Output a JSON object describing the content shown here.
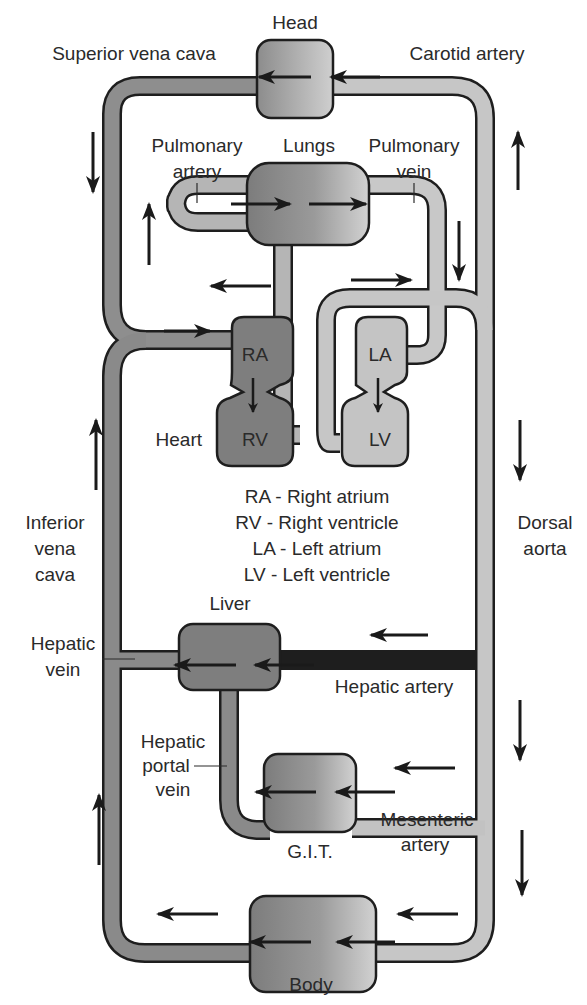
{
  "colors": {
    "deoxygenated_vessel": "#8a8a8a",
    "oxygenated_vessel": "#c6c6c6",
    "outline": "#1e1e1e",
    "arrow": "#1a1a1a",
    "right_heart": "#7e7e7e",
    "left_heart": "#c4c4c4",
    "organ_dark": "#7a7a7a",
    "organ_light": "#cfcfcf"
  },
  "organs": {
    "head": "Head",
    "lungs": "Lungs",
    "heart": "Heart",
    "liver": "Liver",
    "git": "G.I.T.",
    "body": "Body"
  },
  "chambers": {
    "ra": "RA",
    "rv": "RV",
    "la": "LA",
    "lv": "LV"
  },
  "vessels": {
    "superior_vena_cava": "Superior vena cava",
    "carotid_artery": "Carotid artery",
    "pulmonary_artery": [
      "Pulmonary",
      "artery"
    ],
    "pulmonary_vein": [
      "Pulmonary",
      "vein"
    ],
    "inferior_vena_cava": [
      "Inferior",
      "vena",
      "cava"
    ],
    "dorsal_aorta": [
      "Dorsal",
      "aorta"
    ],
    "hepatic_vein": [
      "Hepatic",
      "vein"
    ],
    "hepatic_artery": "Hepatic artery",
    "hepatic_portal_vein": [
      "Hepatic",
      "portal",
      "vein"
    ],
    "mesenteric_artery": [
      "Mesenteric",
      "artery"
    ]
  },
  "legend": [
    "RA - Right atrium",
    "RV - Right ventricle",
    "LA - Left atrium",
    "LV - Left ventricle"
  ],
  "flow_arrows": [
    {
      "location": "head",
      "direction": "left"
    },
    {
      "location": "lungs",
      "direction": "right"
    },
    {
      "location": "superior-vena-cava",
      "direction": "down"
    },
    {
      "location": "carotid-artery",
      "direction": "up"
    },
    {
      "location": "pulmonary-artery",
      "direction": "up"
    },
    {
      "location": "pulmonary-vein",
      "direction": "down"
    },
    {
      "location": "into-right-atrium",
      "direction": "right"
    },
    {
      "location": "inferior-vena-cava",
      "direction": "up"
    },
    {
      "location": "dorsal-aorta",
      "direction": "down"
    },
    {
      "location": "liver",
      "direction": "left"
    },
    {
      "location": "git",
      "direction": "left"
    },
    {
      "location": "body",
      "direction": "left"
    }
  ]
}
